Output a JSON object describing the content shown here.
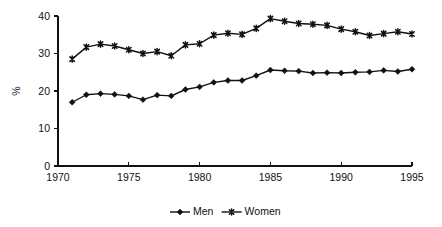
{
  "chart_data": {
    "type": "line",
    "title": "",
    "subtitle": "",
    "xlabel": "",
    "ylabel": "%",
    "xlim": [
      1970,
      1995
    ],
    "ylim": [
      0,
      40
    ],
    "grid": false,
    "legend_position": "bottom",
    "x_ticks": [
      "1970",
      "1975",
      "1980",
      "1985",
      "1990",
      "1995"
    ],
    "x_tick_values": [
      1970,
      1975,
      1980,
      1985,
      1990,
      1995
    ],
    "y_ticks": [
      "0",
      "10",
      "20",
      "30",
      "40"
    ],
    "y_tick_values": [
      0,
      10,
      20,
      30,
      40
    ],
    "x": [
      1971,
      1972,
      1973,
      1974,
      1975,
      1976,
      1977,
      1978,
      1979,
      1980,
      1981,
      1982,
      1983,
      1984,
      1985,
      1986,
      1987,
      1988,
      1989,
      1990,
      1991,
      1992,
      1993,
      1994,
      1995
    ],
    "series": [
      {
        "name": "Men",
        "marker": "diamond",
        "color": "#111111",
        "values": [
          17.0,
          19.0,
          19.3,
          19.1,
          18.7,
          17.7,
          18.9,
          18.7,
          20.4,
          21.1,
          22.3,
          22.8,
          22.8,
          24.1,
          25.6,
          25.4,
          25.3,
          24.8,
          24.9,
          24.8,
          25.0,
          25.1,
          25.5,
          25.2,
          25.8
        ]
      },
      {
        "name": "Women",
        "marker": "star",
        "color": "#111111",
        "values": [
          28.5,
          31.7,
          32.5,
          32.0,
          31.0,
          30.0,
          30.5,
          29.4,
          32.3,
          32.6,
          34.9,
          35.4,
          35.1,
          36.7,
          39.3,
          38.6,
          38.0,
          37.8,
          37.5,
          36.5,
          35.8,
          34.8,
          35.3,
          35.8,
          35.2
        ]
      }
    ]
  },
  "legend": {
    "items": [
      {
        "label": "Men",
        "marker": "diamond"
      },
      {
        "label": "Women",
        "marker": "star"
      }
    ]
  }
}
